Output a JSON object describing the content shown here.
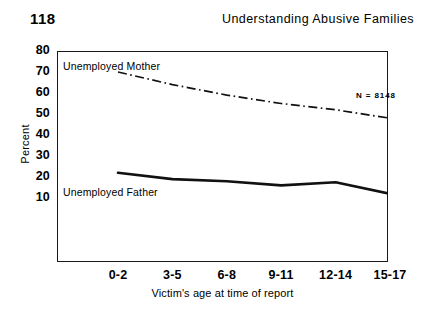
{
  "page": {
    "number": "118",
    "running_head": "Understanding Abusive Families"
  },
  "chart_data": {
    "type": "line",
    "title": "",
    "xlabel": "Victim's age at time of report",
    "ylabel": "Percent",
    "categories": [
      "0-2",
      "3-5",
      "6-8",
      "9-11",
      "12-14",
      "15-17"
    ],
    "ylim": [
      0,
      80
    ],
    "yticks": [
      80,
      70,
      60,
      50,
      40,
      30,
      20,
      10
    ],
    "ytick_labels": [
      "80",
      "70",
      "60",
      "50",
      "40",
      "30",
      "20",
      "10"
    ],
    "grid": false,
    "legend_position": "inline-labels",
    "annotations": [
      {
        "text": "N = 8148",
        "position": "top-right"
      }
    ],
    "series": [
      {
        "name": "Unemployed Mother",
        "label": "Unemployed Mother",
        "style": "dash-dot",
        "color": "#111111",
        "values": [
          70,
          64,
          59,
          55,
          52,
          48
        ]
      },
      {
        "name": "Unemployed Father",
        "label": "Unemployed Father",
        "style": "solid",
        "color": "#111111",
        "values": [
          22,
          19,
          18,
          16,
          17.5,
          12
        ]
      }
    ]
  }
}
